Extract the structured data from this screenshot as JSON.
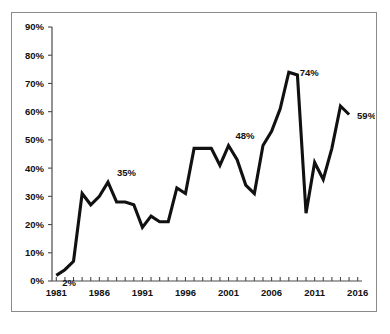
{
  "chart_data": {
    "type": "line",
    "title": "",
    "subtitle": "",
    "xlabel": "",
    "ylabel": "",
    "x": [
      1981,
      1982,
      1983,
      1984,
      1985,
      1986,
      1987,
      1988,
      1989,
      1990,
      1991,
      1992,
      1993,
      1994,
      1995,
      1996,
      1997,
      1998,
      1999,
      2000,
      2001,
      2002,
      2003,
      2004,
      2005,
      2006,
      2007,
      2008,
      2009,
      2010,
      2011,
      2012,
      2013,
      2014,
      2015
    ],
    "values": [
      2,
      4,
      7,
      31,
      27,
      30,
      35,
      28,
      28,
      27,
      19,
      23,
      21,
      21,
      33,
      31,
      47,
      47,
      47,
      41,
      48,
      43,
      34,
      31,
      48,
      53,
      61,
      74,
      73,
      24,
      42,
      36,
      47,
      62,
      59
    ],
    "series": [
      {
        "name": "percentage",
        "values": [
          2,
          4,
          7,
          31,
          27,
          30,
          35,
          28,
          28,
          27,
          19,
          23,
          21,
          21,
          33,
          31,
          47,
          47,
          47,
          41,
          48,
          43,
          34,
          31,
          48,
          53,
          61,
          74,
          73,
          24,
          42,
          36,
          47,
          62,
          59
        ]
      }
    ],
    "xlim": [
      1980.5,
      2016.5
    ],
    "ylim": [
      0,
      90
    ],
    "grid": false,
    "legend": false,
    "legend_position": "none",
    "line_color": "#111111",
    "y_ticks": [
      0,
      10,
      20,
      30,
      40,
      50,
      60,
      70,
      80,
      90
    ],
    "y_tick_labels": [
      "0%",
      "10%",
      "20%",
      "30%",
      "40%",
      "50%",
      "60%",
      "70%",
      "80%",
      "90%"
    ],
    "x_ticks_all": [
      1981,
      1982,
      1983,
      1984,
      1985,
      1986,
      1987,
      1988,
      1989,
      1990,
      1991,
      1992,
      1993,
      1994,
      1995,
      1996,
      1997,
      1998,
      1999,
      2000,
      2001,
      2002,
      2003,
      2004,
      2005,
      2006,
      2007,
      2008,
      2009,
      2010,
      2011,
      2012,
      2013,
      2014,
      2015,
      2016
    ],
    "x_tick_labels_shown": [
      "1981",
      "1986",
      "1991",
      "1996",
      "2001",
      "2006",
      "2011",
      "2016"
    ],
    "x_tick_labels_shown_values": [
      1981,
      1986,
      1991,
      1996,
      2001,
      2006,
      2011,
      2016
    ],
    "annotations": [
      {
        "text": "2%",
        "x": 1981,
        "y": 2
      },
      {
        "text": "35%",
        "x": 1987,
        "y": 35
      },
      {
        "text": "48%",
        "x": 2001,
        "y": 48
      },
      {
        "text": "74%",
        "x": 2008,
        "y": 74
      },
      {
        "text": "59%",
        "x": 2015,
        "y": 59
      }
    ]
  },
  "figure": {
    "border_color": "#8a8a8a",
    "background": "#ffffff",
    "caption_cutoff": ""
  }
}
